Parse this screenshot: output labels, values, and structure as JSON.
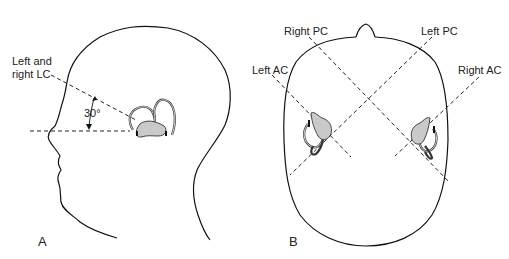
{
  "panels": [
    {
      "id": "A",
      "label": "A",
      "view": "lateral",
      "annotations": {
        "lc_line1": "Left and",
        "lc_line2": "right LC",
        "angle": "30°"
      }
    },
    {
      "id": "B",
      "label": "B",
      "view": "superior",
      "annotations": {
        "right_pc": "Right PC",
        "left_pc": "Left PC",
        "left_ac": "Left AC",
        "right_ac": "Right AC"
      }
    }
  ],
  "colors": {
    "line": "#111111",
    "labyrinth_fill": "#c9c9c9",
    "background": "#ffffff"
  }
}
